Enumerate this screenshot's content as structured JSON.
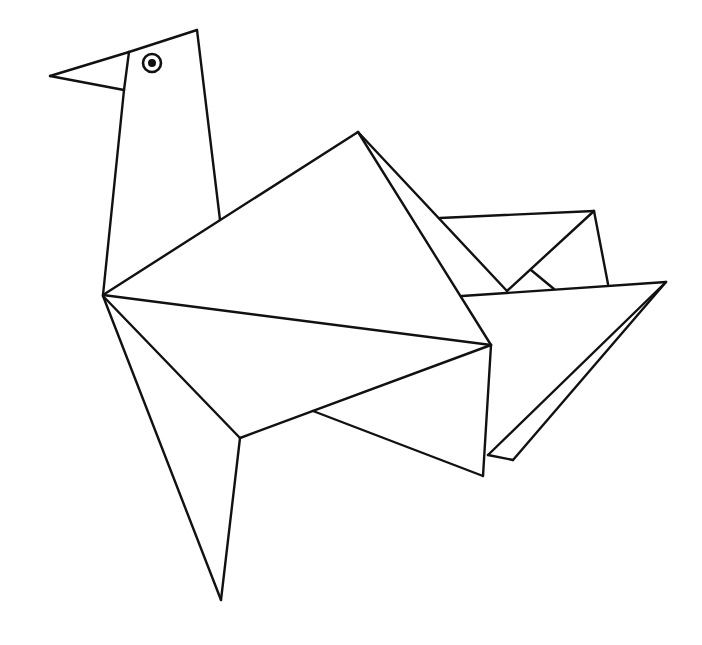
{
  "image": {
    "subject": "origami bird line drawing",
    "width": 702,
    "height": 645,
    "background": "#ffffff",
    "stroke_color": "#111111"
  },
  "drawing": {
    "eye": {
      "cx": 152,
      "cy": 63,
      "r_outer": 9,
      "r_pupil": 4
    },
    "segments": [
      {
        "part": "beak-top",
        "pts": [
          50,
          76,
          129,
          52
        ]
      },
      {
        "part": "beak-bottom",
        "pts": [
          50,
          76,
          124,
          90
        ]
      },
      {
        "part": "beak-base",
        "pts": [
          129,
          52,
          124,
          90
        ]
      },
      {
        "part": "head-top",
        "pts": [
          129,
          52,
          197,
          30
        ]
      },
      {
        "part": "neck-left",
        "pts": [
          124,
          90,
          103,
          295
        ]
      },
      {
        "part": "neck-right",
        "pts": [
          197,
          30,
          220,
          220
        ]
      },
      {
        "part": "back-upper",
        "pts": [
          103,
          295,
          358,
          132
        ]
      },
      {
        "part": "body-centerline",
        "pts": [
          103,
          295,
          491,
          345
        ]
      },
      {
        "part": "wing-fold-a",
        "pts": [
          358,
          132,
          491,
          345
        ]
      },
      {
        "part": "wing-fold-b",
        "pts": [
          358,
          132,
          507,
          291
        ]
      },
      {
        "part": "back-fold-top",
        "pts": [
          440,
          218,
          594,
          211
        ]
      },
      {
        "part": "back-fold-diag",
        "pts": [
          507,
          291,
          594,
          211
        ]
      },
      {
        "part": "back-fold-right",
        "pts": [
          594,
          211,
          608,
          284
        ]
      },
      {
        "part": "back-fold-small",
        "pts": [
          531,
          270,
          554,
          289
        ]
      },
      {
        "part": "tail-top",
        "pts": [
          462,
          296,
          666,
          282
        ]
      },
      {
        "part": "tail-outer",
        "pts": [
          666,
          282,
          513,
          460
        ]
      },
      {
        "part": "tail-inner",
        "pts": [
          666,
          282,
          488,
          455
        ]
      },
      {
        "part": "tail-bottom",
        "pts": [
          488,
          455,
          513,
          460
        ]
      },
      {
        "part": "body-right-edge",
        "pts": [
          491,
          345,
          483,
          476
        ]
      },
      {
        "part": "belly-fold-upper",
        "pts": [
          240,
          438,
          491,
          345
        ]
      },
      {
        "part": "belly-fold-lower",
        "pts": [
          313,
          411,
          483,
          476
        ]
      },
      {
        "part": "leg-inner",
        "pts": [
          103,
          296,
          240,
          438
        ]
      },
      {
        "part": "leg-outer",
        "pts": [
          103,
          296,
          221,
          600
        ]
      },
      {
        "part": "leg-front",
        "pts": [
          240,
          438,
          221,
          600
        ]
      }
    ]
  }
}
